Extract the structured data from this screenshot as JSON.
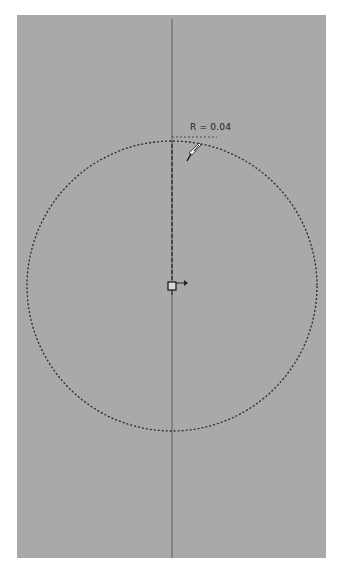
{
  "viewport": {
    "background_color": "#a9a9a9",
    "border_color": "#ffffff"
  },
  "sketch": {
    "tool": "circle",
    "dimension_label": "R = 0.04",
    "radius_value": "0.04",
    "line_color": "#2a2a2a",
    "axis_color": "#5a5a5a",
    "icons": {
      "cursor": "sketch-pointer-icon",
      "center": "center-point-icon"
    }
  }
}
